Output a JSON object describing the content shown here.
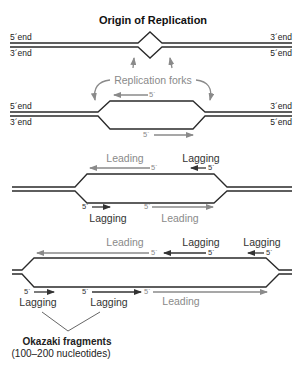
{
  "title": "Origin of Replication",
  "panel1": {
    "left_top": "5´end",
    "left_bottom": "3´end",
    "right_top": "3´end",
    "right_bottom": "5´end"
  },
  "panel2": {
    "forks_label": "Replication forks",
    "left_top": "5´end",
    "left_bottom": "3´end",
    "right_top": "3´end",
    "right_bottom": "5´end",
    "top_primer": "5´",
    "bottom_primer": "5´"
  },
  "panel3": {
    "top_leading": "Leading",
    "top_lagging": "Lagging",
    "top_leading_5": "5´",
    "top_lagging_5": "5´",
    "bottom_lagging": "Lagging",
    "bottom_leading": "Leading",
    "bottom_lagging_5": "5´",
    "bottom_leading_5": "5´"
  },
  "panel4": {
    "top_leading": "Leading",
    "top_lagging_1": "Lagging",
    "top_lagging_2": "Lagging",
    "top_leading_5": "5´",
    "top_lagging_1_5": "5´",
    "top_lagging_2_5": "5´",
    "bottom_lagging_1": "Lagging",
    "bottom_lagging_2": "Lagging",
    "bottom_leading": "Leading",
    "bottom_lagging_1_5": "5´",
    "bottom_lagging_2_5": "5´",
    "bottom_leading_5": "5´"
  },
  "okazaki": {
    "label": "Okazaki fragments",
    "sublabel": "(100–200 nucleotides)"
  },
  "colors": {
    "strand": "#2a2a2a",
    "new_strand_gray": "#8a8a8a",
    "new_strand_dark": "#333333"
  }
}
